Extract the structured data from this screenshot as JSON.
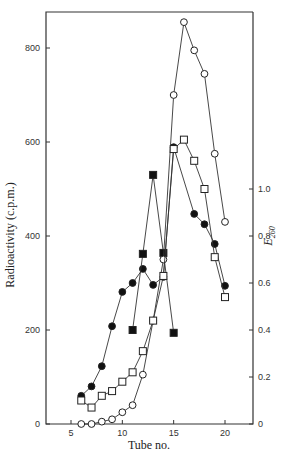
{
  "chart_data": {
    "type": "line",
    "title": "",
    "xlabel": "Tube no.",
    "ylabel": "Radioactivity (c.p.m.)",
    "y2label": "E260",
    "y2label_main": "E",
    "y2label_sub": "260",
    "xlim": [
      2.5,
      23.5
    ],
    "ylim": [
      0,
      870
    ],
    "y2lim": [
      0,
      1.74
    ],
    "x_ticks": [
      5,
      10,
      15,
      20
    ],
    "y_ticks": [
      0,
      200,
      400,
      600,
      800
    ],
    "y2_ticks": [
      0,
      0.2,
      0.4,
      0.6,
      0.8,
      1.0
    ],
    "y2_tick_labels": [
      "0",
      "0.2",
      "0.4",
      "0.6",
      "0.8",
      "1.0"
    ],
    "grid": false,
    "legend": null,
    "series": [
      {
        "name": "filled circles",
        "marker": "filled-circle",
        "axis": "left",
        "x": [
          6,
          7,
          8,
          9,
          10,
          11,
          12,
          13,
          14,
          15,
          17,
          18,
          19,
          20
        ],
        "values": [
          60,
          80,
          123,
          208,
          281,
          300,
          330,
          296,
          313,
          589,
          447,
          425,
          383,
          294
        ]
      },
      {
        "name": "filled squares",
        "marker": "filled-square",
        "axis": "left",
        "x": [
          11,
          12,
          13,
          14,
          15
        ],
        "values": [
          200,
          362,
          530,
          364,
          194
        ]
      },
      {
        "name": "open circles",
        "marker": "open-circle",
        "axis": "right",
        "x": [
          6,
          7,
          8,
          9,
          10,
          11,
          12,
          13,
          14,
          15,
          16,
          17,
          18,
          19,
          20
        ],
        "values": [
          0.0,
          0.0,
          0.01,
          0.02,
          0.05,
          0.08,
          0.21,
          0.44,
          0.7,
          1.4,
          1.71,
          1.59,
          1.49,
          1.15,
          0.86
        ]
      },
      {
        "name": "open squares",
        "marker": "open-square",
        "axis": "right",
        "x": [
          6,
          7,
          8,
          9,
          10,
          11,
          12,
          13,
          14,
          15,
          16,
          17,
          18,
          19,
          20
        ],
        "values": [
          0.1,
          0.07,
          0.12,
          0.14,
          0.18,
          0.22,
          0.31,
          0.44,
          0.63,
          1.17,
          1.21,
          1.12,
          1.0,
          0.71,
          0.54
        ]
      }
    ]
  }
}
